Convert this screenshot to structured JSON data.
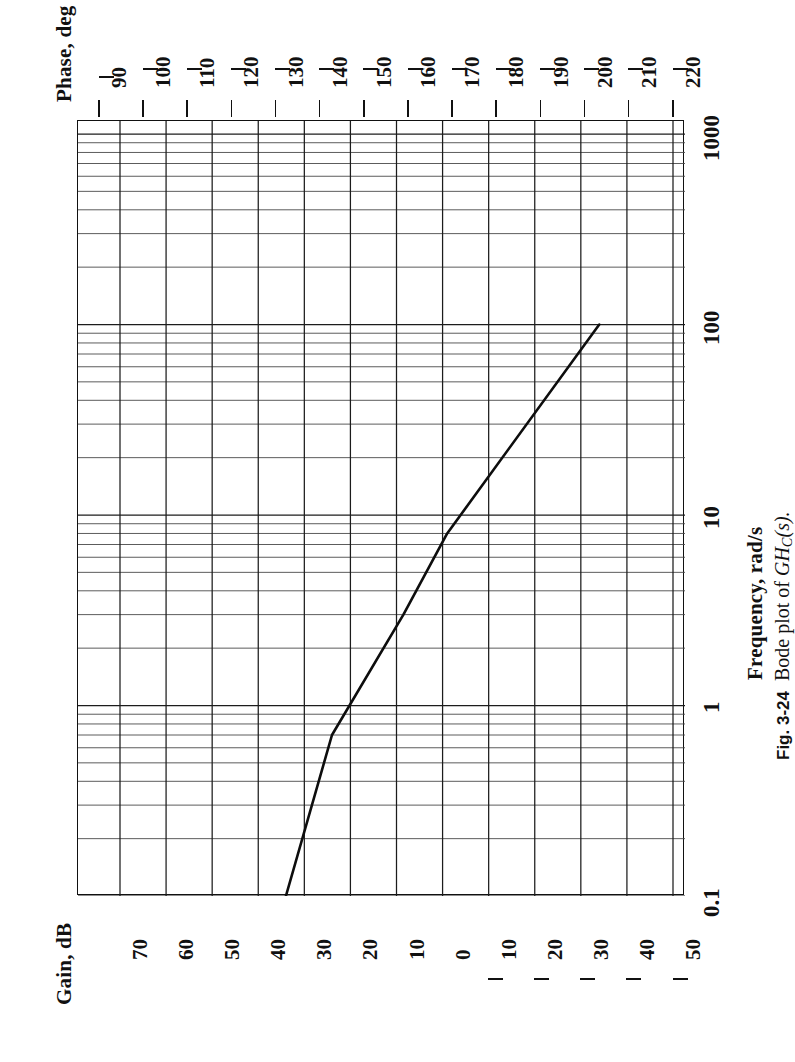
{
  "figure": {
    "caption_number": "Fig. 3-24",
    "caption_text_pre": "Bode plot of ",
    "caption_fn": "GH",
    "caption_fn_sub": "C",
    "caption_fn_post": "(s).",
    "caption_full": "Fig. 3-24  Bode plot of GHC(s)."
  },
  "axes": {
    "phase": {
      "title": "Phase, deg",
      "ticks": [
        "–90",
        "–100",
        "–110",
        "–120",
        "–130",
        "–140",
        "–150",
        "–160",
        "–170",
        "–180",
        "–190",
        "–200",
        "–210",
        "–220"
      ],
      "values": [
        -90,
        -100,
        -110,
        -120,
        -130,
        -140,
        -150,
        -160,
        -170,
        -180,
        -190,
        -200,
        -210,
        -220
      ]
    },
    "gain": {
      "title": "Gain, dB",
      "ticks": [
        "70",
        "60",
        "50",
        "40",
        "30",
        "20",
        "10",
        "0",
        "–10",
        "–20",
        "–30",
        "–40",
        "–50"
      ],
      "values": [
        70,
        60,
        50,
        40,
        30,
        20,
        10,
        0,
        -10,
        -20,
        -30,
        -40,
        -50
      ]
    },
    "frequency": {
      "title": "Frequency, rad/s",
      "ticks": [
        "0.1",
        "1",
        "10",
        "100",
        "1000"
      ],
      "values": [
        0.1,
        1,
        10,
        100,
        1000
      ]
    }
  },
  "chart_data": {
    "type": "line",
    "subtitle": "",
    "orientation": "rotated-90",
    "xlabel": "Frequency, rad/s",
    "ylabel": "Gain, dB",
    "y2label": "Phase, deg",
    "xscale": "log",
    "xlim": [
      0.1,
      1000
    ],
    "ylim": [
      -50,
      80
    ],
    "y2lim": [
      -220,
      -85
    ],
    "grid": true,
    "legend": false,
    "xticks": [
      0.1,
      1,
      10,
      100,
      1000
    ],
    "xticklabels": [
      "0.1",
      "1",
      "10",
      "100",
      "1000"
    ],
    "yticks": [
      70,
      60,
      50,
      40,
      30,
      20,
      10,
      0,
      -10,
      -20,
      -30,
      -40,
      -50
    ],
    "y2ticks": [
      -90,
      -100,
      -110,
      -120,
      -130,
      -140,
      -150,
      -160,
      -170,
      -180,
      -190,
      -200,
      -210,
      -220
    ],
    "series": [
      {
        "name": "Gain",
        "units": "dB",
        "x": [
          0.1,
          0.7,
          3.0,
          8.0,
          100.0
        ],
        "values": [
          34.0,
          24.0,
          8.5,
          -1.0,
          -34.0
        ],
        "note": "asymptotic magnitude curve; enters plot at 0.1 rad/s near 34 dB and descends to about –34 dB near 100 rad/s, with break points near 0.7, 3 and 8 rad/s"
      }
    ]
  },
  "colors": {
    "ink": "#111111",
    "grid_major": "#333333",
    "grid_minor": "#555555",
    "paper": "#ffffff"
  }
}
